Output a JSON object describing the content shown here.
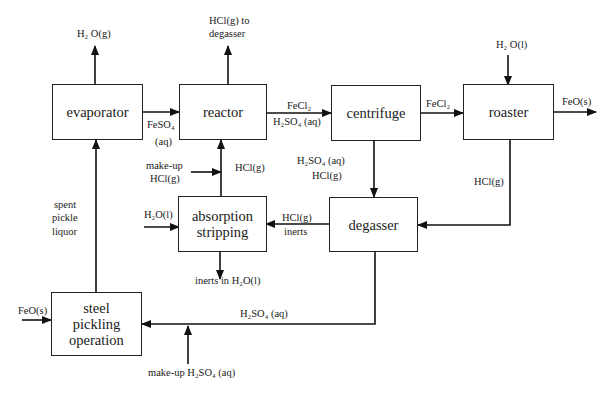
{
  "diagram": {
    "units": {
      "evaporator": "evaporator",
      "reactor": "reactor",
      "centrifuge": "centrifuge",
      "roaster": "roaster",
      "absorption_line1": "absorption",
      "absorption_line2": "stripping",
      "degasser": "degasser",
      "pickling_line1": "steel",
      "pickling_line2": "pickling",
      "pickling_line3": "operation"
    },
    "streams": {
      "evap_vapor": "H₂ O(g)",
      "reactor_vent_1": "HCl(g) to",
      "reactor_vent_2": "degasser",
      "feso4_1": "FeSO₄",
      "feso4_2": "(aq)",
      "reactor_out_1": "FeCl₂",
      "reactor_out_2": "H₂SO₄ (aq)",
      "centrifuge_out": "FeCl₂",
      "roaster_water": "H₂ O(l)",
      "roaster_product": "FeO(s)",
      "makeup_hcl_1": "make-up",
      "makeup_hcl_2": "HCl(g)",
      "hcl_to_reactor": "HCl(g)",
      "centrifuge_liquor_1": "H₂SO₄ (aq)",
      "centrifuge_liquor_2": "HCl(g)",
      "roaster_hcl": "HCl(g)",
      "spent_1": "spent",
      "spent_2": "pickle",
      "spent_3": "liquor",
      "absorber_water": "H₂O(l)",
      "degasser_gas_1": "HCl(g)",
      "degasser_gas_2": "inerts",
      "absorber_out": "inerts in H₂O(l)",
      "feo_in": "FeO(s)",
      "acid_return": "H₂SO₄ (aq)",
      "makeup_acid": "make-up H₂SO₄ (aq)"
    }
  }
}
